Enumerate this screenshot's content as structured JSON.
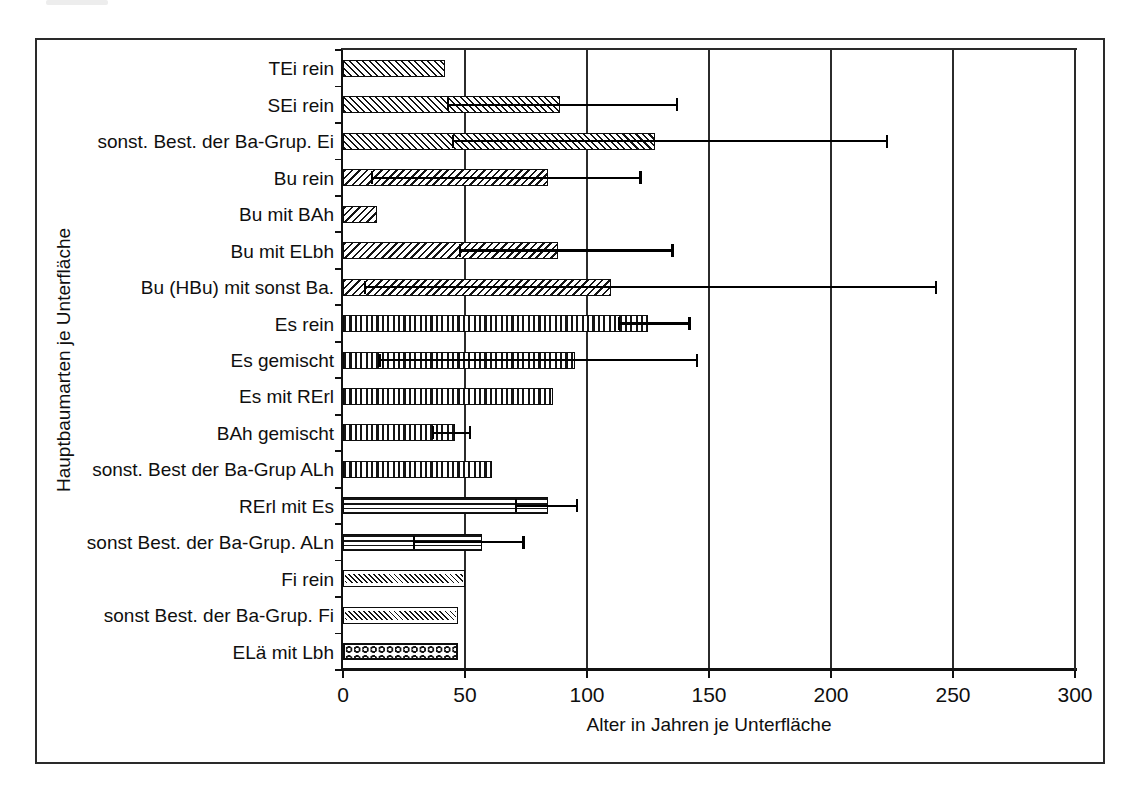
{
  "ink_color": "#111111",
  "paper_color": "#ffffff",
  "scan_artifact": "faint gray streak top-left corner",
  "chart_data": {
    "type": "bar",
    "orientation": "horizontal",
    "title": "",
    "xlabel": "Alter in Jahren je Unterfläche",
    "ylabel": "Hauptbaumarten je Unterfläche",
    "xlim": [
      0,
      300
    ],
    "x_ticks": [
      0,
      50,
      100,
      150,
      200,
      250,
      300
    ],
    "x_tick_labels": [
      "0",
      "50",
      "100",
      "150",
      "200",
      "250",
      "300"
    ],
    "grid": "vertical gridlines at each x tick, behind bars",
    "legend": "none",
    "categories": [
      "TEi rein",
      "SEi rein",
      "sonst. Best. der Ba-Grup. Ei",
      "Bu rein",
      "Bu mit BAh",
      "Bu mit ELbh",
      "Bu (HBu) mit sonst Ba.",
      "Es rein",
      "Es gemischt",
      "Es mit RErl",
      "BAh gemischt",
      "sonst. Best der Ba-Grup ALh",
      "RErl mit Es",
      "sonst Best. der Ba-Grup. ALn",
      "Fi rein",
      "sonst Best. der Ba-Grup. Fi",
      "ELä mit Lbh"
    ],
    "values": [
      42,
      89,
      128,
      84,
      14,
      88,
      110,
      125,
      95,
      86,
      46,
      61,
      84,
      57,
      50,
      47,
      47
    ],
    "error_bars": [
      null,
      [
        43,
        137
      ],
      [
        45,
        223
      ],
      [
        12,
        122
      ],
      null,
      [
        48,
        135
      ],
      [
        9,
        243
      ],
      [
        113,
        142
      ],
      [
        15,
        145
      ],
      null,
      [
        37,
        52
      ],
      null,
      [
        71,
        96
      ],
      [
        29,
        74
      ],
      null,
      null,
      null
    ],
    "bar_patterns": [
      "diagback",
      "diagback",
      "diagback",
      "diagfwd",
      "diagfwd",
      "diagfwd",
      "diagfwd",
      "vert",
      "vert",
      "vert",
      "vert",
      "vert",
      "horiz",
      "horiz",
      "finediag",
      "finediag",
      "dots"
    ]
  }
}
